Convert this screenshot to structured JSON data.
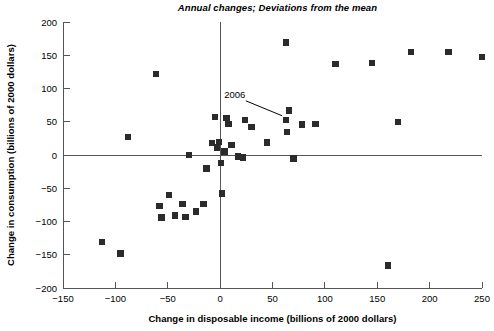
{
  "chart_data": {
    "type": "scatter",
    "title": "Annual changes; Deviations from the mean",
    "xlabel": "Change in disposable income (billions of 2000 dollars)",
    "ylabel": "Change in consumption (billions of 2000 dollars)",
    "xlim": [
      -150,
      250
    ],
    "ylim": [
      -200,
      200
    ],
    "xticks": [
      -150,
      -100,
      -50,
      0,
      50,
      100,
      150,
      200,
      250
    ],
    "yticks": [
      -200,
      -150,
      -100,
      -50,
      0,
      50,
      100,
      150,
      200
    ],
    "xtick_labels": [
      "-150",
      "-100",
      "-50",
      "0",
      "50",
      "100",
      "150",
      "200",
      "250"
    ],
    "ytick_labels": [
      "-200",
      "-150",
      "-100",
      "-50",
      "0",
      "50",
      "100",
      "150",
      "200"
    ],
    "grid": false,
    "legend": null,
    "marker": "square",
    "marker_color": "#2b2b2b",
    "axis_color": "#555555",
    "zero_lines": {
      "x": 0,
      "y": 0
    },
    "annotations": [
      {
        "text": "2006",
        "label_x": 14,
        "label_y": 86,
        "point_x": 63,
        "point_y": 53
      }
    ],
    "points": [
      {
        "x": -113,
        "y": -131
      },
      {
        "x": -95,
        "y": -148
      },
      {
        "x": -88,
        "y": 27
      },
      {
        "x": -61,
        "y": 122
      },
      {
        "x": -58,
        "y": -77
      },
      {
        "x": -56,
        "y": -94
      },
      {
        "x": -49,
        "y": -60
      },
      {
        "x": -43,
        "y": -91
      },
      {
        "x": -36,
        "y": -74
      },
      {
        "x": -33,
        "y": -93
      },
      {
        "x": -30,
        "y": 0
      },
      {
        "x": -23,
        "y": -85
      },
      {
        "x": -16,
        "y": -74
      },
      {
        "x": -13,
        "y": -20
      },
      {
        "x": -8,
        "y": 18
      },
      {
        "x": -5,
        "y": 57
      },
      {
        "x": -3,
        "y": 11
      },
      {
        "x": -1,
        "y": 20
      },
      {
        "x": 1,
        "y": -12
      },
      {
        "x": 2,
        "y": -58
      },
      {
        "x": 4,
        "y": 5
      },
      {
        "x": 6,
        "y": 56
      },
      {
        "x": 8,
        "y": 47
      },
      {
        "x": 11,
        "y": 15
      },
      {
        "x": 17,
        "y": -2
      },
      {
        "x": 22,
        "y": -4
      },
      {
        "x": 24,
        "y": 53
      },
      {
        "x": 30,
        "y": 42
      },
      {
        "x": 45,
        "y": 19
      },
      {
        "x": 63,
        "y": 169
      },
      {
        "x": 63,
        "y": 53
      },
      {
        "x": 64,
        "y": 35
      },
      {
        "x": 66,
        "y": 67
      },
      {
        "x": 70,
        "y": -5
      },
      {
        "x": 78,
        "y": 46
      },
      {
        "x": 91,
        "y": 47
      },
      {
        "x": 110,
        "y": 137
      },
      {
        "x": 145,
        "y": 138
      },
      {
        "x": 160,
        "y": -166
      },
      {
        "x": 170,
        "y": 50
      },
      {
        "x": 182,
        "y": 155
      },
      {
        "x": 218,
        "y": 155
      },
      {
        "x": 250,
        "y": 147
      }
    ]
  }
}
